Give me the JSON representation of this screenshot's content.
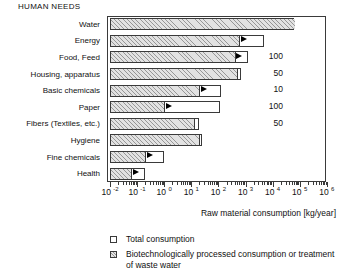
{
  "header": {
    "title": "HUMAN NEEDS"
  },
  "axis": {
    "title": "Raw material consumption [kg/year]",
    "tick_labels": [
      "10 -2",
      "10 -1",
      "10 0",
      "10 1",
      "10 2",
      "10 3",
      "10 4",
      "10 5",
      "10 6"
    ],
    "tick_mantissa": "10",
    "tick_exponents": [
      "-2",
      "-1",
      "0",
      "1",
      "2",
      "3",
      "4",
      "5",
      "6"
    ]
  },
  "legend": {
    "items": [
      {
        "swatch": "open-square",
        "label": "Total consumption"
      },
      {
        "swatch": "hatched-square",
        "label": "Biotechnologically processed consumption or treatment of waste water"
      }
    ]
  },
  "chart_data": {
    "type": "bar",
    "title": "HUMAN NEEDS",
    "xlabel": "Raw material consumption [kg/year]",
    "ylabel": "",
    "orientation": "horizontal",
    "xscale": "log",
    "xlim": [
      0.01,
      1000000
    ],
    "grid": false,
    "legend_position": "below",
    "categories": [
      "Water",
      "Energy",
      "Food, Feed",
      "Housing, apparatus",
      "Basic chemicals",
      "Paper",
      "Fibers (Textiles, etc.)",
      "Hygiene",
      "Fine chemicals",
      "Health"
    ],
    "series": [
      {
        "name": "Total consumption",
        "values": [
          60000,
          5000,
          1200,
          700,
          130,
          110,
          20,
          25,
          1.0,
          0.2
        ]
      },
      {
        "name": "Biotechnologically processed consumption or treatment of waste water",
        "values": [
          60000,
          600,
          400,
          500,
          20,
          1.0,
          13,
          20,
          0.2,
          0.06
        ]
      }
    ],
    "value_annotations": [
      "",
      "",
      "100",
      "50",
      "10",
      "100",
      "50",
      "",
      "",
      ""
    ],
    "annotation_note": "Numbers at right give the factor between total and biotechnologically processed amounts",
    "arrow_markers": [
      false,
      true,
      true,
      false,
      true,
      true,
      false,
      false,
      true,
      true
    ]
  }
}
